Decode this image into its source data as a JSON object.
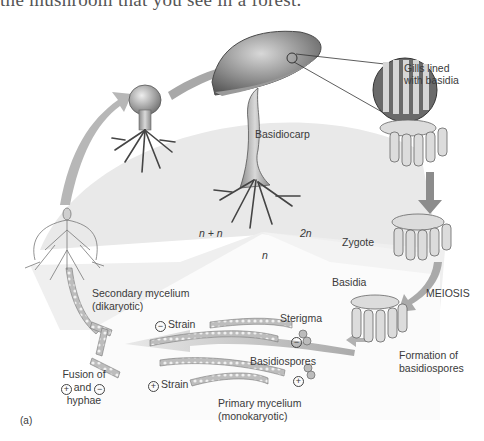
{
  "header": {
    "partial_text": "the mushroom that you see in a forest."
  },
  "diagram": {
    "title_marker": "(a)",
    "ploidy_regions": {
      "dikaryon": "n + n",
      "diploid": "2n",
      "haploid": "n"
    },
    "labels": {
      "basidiocarp": "Basidiocarp",
      "gills": "Gills lined\nwith basidia",
      "gills_line1": "Gills lined",
      "gills_line2": "with basidia",
      "zygote": "Zygote",
      "basidia": "Basidia",
      "meiosis": "MEIOSIS",
      "formation_line1": "Formation of",
      "formation_line2": "basidiospores",
      "sterigma": "Sterigma",
      "basidiospores": "Basidiospores",
      "minus_strain": "Strain",
      "plus_strain": "Strain",
      "primary_line1": "Primary mycelium",
      "primary_line2": "(monokaryotic)",
      "secondary_line1": "Secondary mycelium",
      "secondary_line2": "(dikaryotic)",
      "fusion_line1": "Fusion of",
      "fusion_and": "and",
      "fusion_line3": "hyphae"
    },
    "signs": {
      "plus": "+",
      "minus": "−"
    },
    "colors": {
      "dikaryon_region": "#e6e6e6",
      "diploid_region": "#f1f1f1",
      "haploid_region": "#fafafa",
      "arrow": "#9a9a9a",
      "ink": "#3a3a3a"
    }
  }
}
